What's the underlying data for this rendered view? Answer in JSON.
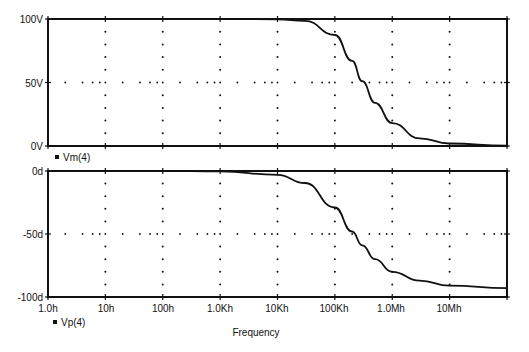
{
  "chart_data": [
    {
      "type": "line",
      "title": "",
      "xlabel": "",
      "ylabel": "",
      "xscale": "log",
      "xlim": [
        1,
        100000000
      ],
      "ylim": [
        0,
        100
      ],
      "y_ticks": [
        "0V",
        "50V",
        "100V"
      ],
      "x_ticks": [
        "1.0h",
        "10h",
        "100h",
        "1.0Kh",
        "10Kh",
        "100Kh",
        "1.0Mh",
        "10Mh"
      ],
      "grid": "dotted",
      "legend": [
        "Vm(4)"
      ],
      "series": [
        {
          "name": "Vm(4)",
          "x": [
            1,
            10,
            100,
            1000,
            10000,
            30000,
            100000,
            200000,
            300000,
            500000,
            1000000,
            3000000,
            10000000,
            100000000
          ],
          "values": [
            100,
            100,
            100,
            100,
            99.8,
            98.6,
            87.4,
            67,
            51,
            34,
            18,
            6,
            2,
            0.2
          ]
        }
      ]
    },
    {
      "type": "line",
      "title": "",
      "xlabel": "Frequency",
      "ylabel": "",
      "xscale": "log",
      "xlim": [
        1,
        100000000
      ],
      "ylim": [
        -100,
        0
      ],
      "y_ticks": [
        "-100d",
        "-50d",
        "0d"
      ],
      "x_ticks": [
        "1.0h",
        "10h",
        "100h",
        "1.0Kh",
        "10Kh",
        "100Kh",
        "1.0Mh",
        "10Mh"
      ],
      "grid": "dotted",
      "legend": [
        "Vp(4)"
      ],
      "series": [
        {
          "name": "Vp(4)",
          "x": [
            1,
            10,
            100,
            1000,
            10000,
            30000,
            100000,
            200000,
            300000,
            500000,
            1000000,
            3000000,
            10000000,
            100000000
          ],
          "values": [
            0,
            0,
            0,
            -0.3,
            -3,
            -9.5,
            -29,
            -48,
            -59,
            -70,
            -80,
            -87,
            -91,
            -93
          ]
        }
      ]
    }
  ],
  "top_plot": {
    "y_labels": [
      "100V",
      "50V",
      "0V"
    ],
    "legend_label": "Vm(4)"
  },
  "bottom_plot": {
    "y_labels": [
      "0d",
      "-50d",
      "-100d"
    ],
    "legend_label": "Vp(4)"
  },
  "x_axis": {
    "tick_labels": [
      "1.0h",
      "10h",
      "100h",
      "1.0Kh",
      "10Kh",
      "100Kh",
      "1.0Mh",
      "10Mh"
    ],
    "title": "Frequency"
  }
}
